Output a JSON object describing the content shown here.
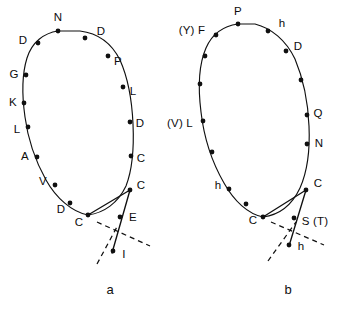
{
  "figure": {
    "background": "#ffffff",
    "stroke_color": "#101010",
    "dot_color": "#101010",
    "panels": [
      {
        "id": "panel-a",
        "caption": "a",
        "caption_pos": [
          110,
          289
        ],
        "loop_path": "M 58 31 C 44 33 32 42 27 58 C 22 74 22 96 25 117 C 28 140 36 162 46 180 C 56 198 72 212 88 215 C 104 213 118 203 126 186 C 133 168 134 146 133 124 C 132 101 128 78 120 60 C 111 42 96 33 80 31 Z",
        "tail_paths": [
          {
            "d": "M 88 215 L 130 190",
            "style": "solid"
          },
          {
            "d": "M 130 190 L 112 253",
            "style": "solid"
          }
        ],
        "dashed_paths": [
          {
            "d": "M 97 222 L 150 246",
            "style": "dashed"
          },
          {
            "d": "M 97 264 L 118 225",
            "style": "dashed"
          }
        ],
        "dots": [
          {
            "x": 58,
            "y": 31,
            "label": "N",
            "lx": 58,
            "ly": 18,
            "anchor": "above"
          },
          {
            "x": 85,
            "y": 38,
            "label": "D",
            "lx": 101,
            "ly": 32,
            "anchor": "right"
          },
          {
            "x": 38,
            "y": 43,
            "label": "D",
            "lx": 23,
            "ly": 41,
            "anchor": "left"
          },
          {
            "x": 108,
            "y": 56,
            "label": "P",
            "lx": 118,
            "ly": 62,
            "anchor": "right"
          },
          {
            "x": 26,
            "y": 75,
            "label": "G",
            "lx": 14,
            "ly": 75,
            "anchor": "left"
          },
          {
            "x": 123,
            "y": 87,
            "label": "L",
            "lx": 133,
            "ly": 92,
            "anchor": "right"
          },
          {
            "x": 24,
            "y": 103,
            "label": "K",
            "lx": 13,
            "ly": 103,
            "anchor": "left"
          },
          {
            "x": 130,
            "y": 122,
            "label": "D",
            "lx": 140,
            "ly": 124,
            "anchor": "right"
          },
          {
            "x": 28,
            "y": 127,
            "label": "L",
            "lx": 17,
            "ly": 130,
            "anchor": "left"
          },
          {
            "x": 37,
            "y": 157,
            "label": "A",
            "lx": 25,
            "ly": 157,
            "anchor": "left"
          },
          {
            "x": 131,
            "y": 156,
            "label": "C",
            "lx": 141,
            "ly": 159,
            "anchor": "right"
          },
          {
            "x": 55,
            "y": 185,
            "label": "V",
            "lx": 43,
            "ly": 182,
            "anchor": "left"
          },
          {
            "x": 130,
            "y": 190,
            "label": "C",
            "lx": 141,
            "ly": 186,
            "anchor": "right"
          },
          {
            "x": 70,
            "y": 203,
            "label": "D",
            "lx": 61,
            "ly": 210,
            "anchor": "left"
          },
          {
            "x": 88,
            "y": 215,
            "label": "C",
            "lx": 79,
            "ly": 223,
            "anchor": "left"
          },
          {
            "x": 120,
            "y": 217,
            "label": "E",
            "lx": 133,
            "ly": 218,
            "anchor": "right"
          },
          {
            "x": 113,
            "y": 251,
            "label": "I",
            "lx": 124,
            "ly": 255,
            "anchor": "right"
          }
        ]
      },
      {
        "id": "panel-b",
        "caption": "b",
        "caption_pos": [
          288,
          289
        ],
        "loop_path": "M 238 24 C 224 26 212 34 206 48 C 199 64 198 88 201 112 C 204 138 213 164 224 183 C 234 201 248 214 263 217 C 279 215 292 205 300 188 C 308 170 310 148 309 126 C 308 102 303 78 295 59 C 286 40 271 28 255 24 Z",
        "tail_paths": [
          {
            "d": "M 263 217 L 306 190",
            "style": "solid"
          },
          {
            "d": "M 306 190 L 289 246",
            "style": "solid"
          }
        ],
        "dashed_paths": [
          {
            "d": "M 271 222 L 324 245",
            "style": "dashed"
          },
          {
            "d": "M 268 261 L 296 222",
            "style": "dashed"
          }
        ],
        "dots": [
          {
            "x": 238,
            "y": 24,
            "label": "P",
            "lx": 238,
            "ly": 12,
            "anchor": "above"
          },
          {
            "x": 268,
            "y": 31,
            "label": "h",
            "lx": 282,
            "ly": 24,
            "anchor": "right"
          },
          {
            "x": 216,
            "y": 35,
            "label": "(Y) F",
            "lx": 192,
            "ly": 31,
            "anchor": "left"
          },
          {
            "x": 286,
            "y": 51,
            "label": "D",
            "lx": 298,
            "ly": 47,
            "anchor": "right"
          },
          {
            "x": 205,
            "y": 56,
            "label": "",
            "lx": 0,
            "ly": 0,
            "anchor": "none"
          },
          {
            "x": 301,
            "y": 80,
            "label": "",
            "lx": 0,
            "ly": 0,
            "anchor": "none"
          },
          {
            "x": 200,
            "y": 84,
            "label": "",
            "lx": 0,
            "ly": 0,
            "anchor": "none"
          },
          {
            "x": 307,
            "y": 115,
            "label": "Q",
            "lx": 318,
            "ly": 114,
            "anchor": "right"
          },
          {
            "x": 203,
            "y": 121,
            "label": "(V) L",
            "lx": 180,
            "ly": 124,
            "anchor": "left"
          },
          {
            "x": 307,
            "y": 144,
            "label": "N",
            "lx": 319,
            "ly": 144,
            "anchor": "right"
          },
          {
            "x": 212,
            "y": 152,
            "label": "",
            "lx": 0,
            "ly": 0,
            "anchor": "none"
          },
          {
            "x": 306,
            "y": 190,
            "label": "C",
            "lx": 318,
            "ly": 184,
            "anchor": "right"
          },
          {
            "x": 229,
            "y": 189,
            "label": "h",
            "lx": 218,
            "ly": 186,
            "anchor": "left"
          },
          {
            "x": 246,
            "y": 204,
            "label": "",
            "lx": 0,
            "ly": 0,
            "anchor": "none"
          },
          {
            "x": 263,
            "y": 217,
            "label": "C",
            "lx": 253,
            "ly": 221,
            "anchor": "left"
          },
          {
            "x": 294,
            "y": 218,
            "label": "S (T)",
            "lx": 315,
            "ly": 222,
            "anchor": "right"
          },
          {
            "x": 289,
            "y": 245,
            "label": "h",
            "lx": 301,
            "ly": 247,
            "anchor": "right"
          }
        ]
      }
    ]
  }
}
